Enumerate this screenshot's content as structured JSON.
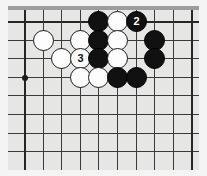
{
  "figure": {
    "type": "go-board-diagram",
    "board_label": "goban"
  },
  "colors": {
    "page_background": "#ffffff",
    "frame": "#f4f4f4",
    "board": "#e6e6e4",
    "grid_line": "#3a3a3a",
    "edge_line": "#262626",
    "black_stone": "#111111",
    "white_stone": "#fdfdfd",
    "black_label_text": "#ffffff",
    "white_label_text": "#111111"
  },
  "board": {
    "origin_x": 16,
    "origin_y": 15,
    "spacing": 18.6,
    "cols": 10,
    "rows": 9,
    "edges": {
      "top": true,
      "left": true,
      "right": true,
      "bottom": false
    },
    "star_points": [
      {
        "col": 0,
        "row": 3
      }
    ]
  },
  "chart_data": {
    "type": "table",
    "stones": [
      {
        "color": "black",
        "col": 4,
        "row": 0,
        "label": ""
      },
      {
        "color": "white",
        "col": 5,
        "row": 0,
        "label": ""
      },
      {
        "color": "black",
        "col": 6,
        "row": 0,
        "label": "2"
      },
      {
        "color": "white",
        "col": 1,
        "row": 1,
        "label": ""
      },
      {
        "color": "white",
        "col": 3,
        "row": 1,
        "label": ""
      },
      {
        "color": "black",
        "col": 4,
        "row": 1,
        "label": ""
      },
      {
        "color": "white",
        "col": 5,
        "row": 1,
        "label": ""
      },
      {
        "color": "black",
        "col": 7,
        "row": 1,
        "label": ""
      },
      {
        "color": "white",
        "col": 2,
        "row": 2,
        "label": ""
      },
      {
        "color": "white",
        "col": 3,
        "row": 2,
        "label": "3"
      },
      {
        "color": "black",
        "col": 4,
        "row": 2,
        "label": ""
      },
      {
        "color": "white",
        "col": 5,
        "row": 2,
        "label": ""
      },
      {
        "color": "black",
        "col": 7,
        "row": 2,
        "label": ""
      },
      {
        "color": "white",
        "col": 3,
        "row": 3,
        "label": ""
      },
      {
        "color": "white",
        "col": 4,
        "row": 3,
        "label": ""
      },
      {
        "color": "black",
        "col": 5,
        "row": 3,
        "label": ""
      },
      {
        "color": "black",
        "col": 6,
        "row": 3,
        "label": ""
      }
    ],
    "move_labels": [
      {
        "number": "2",
        "color": "black",
        "col": 6,
        "row": 0
      },
      {
        "number": "3",
        "color": "white",
        "col": 3,
        "row": 2
      }
    ],
    "xlabel": "",
    "ylabel": "",
    "legend": []
  }
}
